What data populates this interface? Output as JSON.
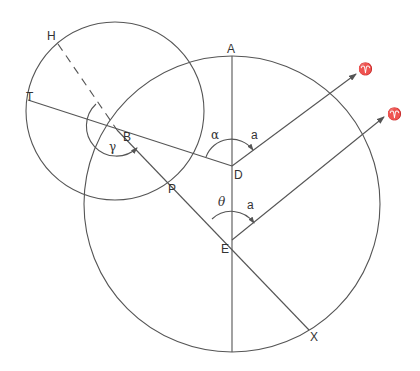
{
  "diagram": {
    "colors": {
      "line": "#555555",
      "text": "#333333",
      "background": "#ffffff"
    },
    "circles": [
      {
        "id": "small-circle",
        "cx": 115,
        "cy": 111,
        "r": 89
      },
      {
        "id": "large-circle",
        "cx": 232,
        "cy": 204,
        "r": 148
      }
    ],
    "segments": [
      {
        "id": "line-T-D",
        "x1": 28,
        "y1": 100,
        "x2": 232,
        "y2": 166,
        "dashed": false
      },
      {
        "id": "line-H-B",
        "x1": 58,
        "y1": 44,
        "x2": 117,
        "y2": 130,
        "dashed": true
      },
      {
        "id": "line-B-X",
        "x1": 117,
        "y1": 130,
        "x2": 309,
        "y2": 330,
        "dashed": false
      },
      {
        "id": "line-A-bottom",
        "x1": 232,
        "y1": 56,
        "x2": 232,
        "y2": 352,
        "dashed": false
      },
      {
        "id": "line-D-aries",
        "x1": 232,
        "y1": 166,
        "x2": 356,
        "y2": 74,
        "dashed": false,
        "arrow": true
      },
      {
        "id": "line-E-aries",
        "x1": 232,
        "y1": 240,
        "x2": 384,
        "y2": 117,
        "dashed": false,
        "arrow": true
      }
    ],
    "arcs": [
      {
        "id": "arc-gamma",
        "d": "M 96 104 A 27 27 0 1 0 137 148",
        "arrow_at": [
          137,
          148
        ]
      },
      {
        "id": "arc-alpha-D",
        "d": "M 206 157 A 27 27 0 0 1 253 150"
      },
      {
        "id": "arc-theta-E",
        "d": "M 212 219 A 28 28 0 0 1 254 223"
      }
    ],
    "labels": [
      {
        "id": "label-H",
        "text": "H",
        "x": 47,
        "y": 40
      },
      {
        "id": "label-T",
        "text": "T",
        "x": 26,
        "y": 101
      },
      {
        "id": "label-B",
        "text": "B",
        "x": 123,
        "y": 141
      },
      {
        "id": "label-gamma",
        "text": "γ",
        "x": 109,
        "y": 151,
        "greek": true
      },
      {
        "id": "label-P",
        "text": "P",
        "x": 168,
        "y": 193
      },
      {
        "id": "label-A",
        "text": "A",
        "x": 227,
        "y": 53
      },
      {
        "id": "label-D",
        "text": "D",
        "x": 234,
        "y": 179
      },
      {
        "id": "label-alpha",
        "text": "α",
        "x": 211,
        "y": 139,
        "greek": true
      },
      {
        "id": "label-a-D",
        "text": "a",
        "x": 251,
        "y": 139
      },
      {
        "id": "label-theta",
        "text": "θ",
        "x": 218,
        "y": 206,
        "greek": true,
        "italic": true
      },
      {
        "id": "label-a-E",
        "text": "a",
        "x": 247,
        "y": 209
      },
      {
        "id": "label-E",
        "text": "E",
        "x": 221,
        "y": 253
      },
      {
        "id": "label-X",
        "text": "X",
        "x": 310,
        "y": 341
      },
      {
        "id": "label-aries-1",
        "text": "♈",
        "x": 358,
        "y": 73,
        "greek": true
      },
      {
        "id": "label-aries-2",
        "text": "♈",
        "x": 387,
        "y": 118,
        "greek": true
      }
    ]
  }
}
